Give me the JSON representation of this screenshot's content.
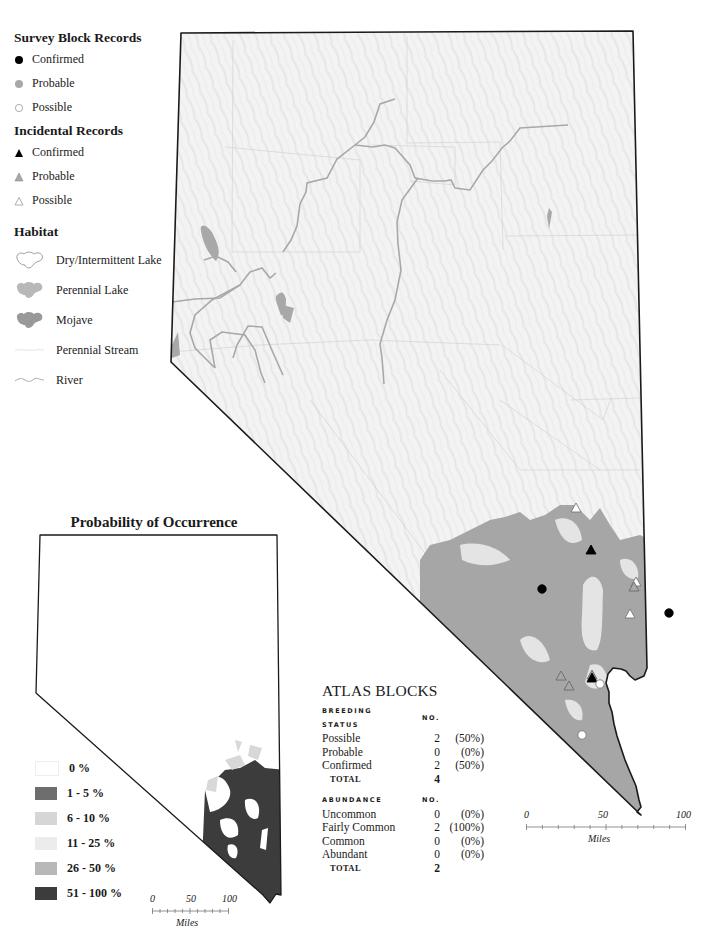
{
  "legend": {
    "survey_block": {
      "heading": "Survey Block Records",
      "items": [
        {
          "label": "Confirmed",
          "symbol": "filled-circle",
          "color": "#000000"
        },
        {
          "label": "Probable",
          "symbol": "gray-circle",
          "color": "#a8a8a8"
        },
        {
          "label": "Possible",
          "symbol": "open-circle",
          "color": "#ffffff"
        }
      ]
    },
    "incidental": {
      "heading": "Incidental Records",
      "items": [
        {
          "label": "Confirmed",
          "symbol": "filled-triangle",
          "color": "#000000"
        },
        {
          "label": "Probable",
          "symbol": "gray-triangle",
          "color": "#a8a8a8"
        },
        {
          "label": "Possible",
          "symbol": "open-triangle",
          "color": "#ffffff"
        }
      ]
    },
    "habitat": {
      "heading": "Habitat",
      "items": [
        {
          "label": "Dry/Intermittent Lake",
          "symbol": "dry-lake-icon"
        },
        {
          "label": "Perennial Lake",
          "symbol": "perennial-lake-icon",
          "color": "#b4b4b4"
        },
        {
          "label": "Mojave",
          "symbol": "mojave-icon",
          "color": "#9a9a9a"
        },
        {
          "label": "Perennial Stream",
          "symbol": "stream-icon"
        },
        {
          "label": "River",
          "symbol": "river-icon"
        }
      ]
    }
  },
  "main_map": {
    "fill": "#f2f2f2",
    "mojave_color": "#a6a6a6",
    "points": [
      {
        "type": "incidental",
        "status": "Possible",
        "x": 576,
        "y": 508
      },
      {
        "type": "incidental",
        "status": "Confirmed",
        "x": 591,
        "y": 550
      },
      {
        "type": "survey",
        "status": "Confirmed",
        "x": 542,
        "y": 589
      },
      {
        "type": "incidental",
        "status": "Possible",
        "x": 636,
        "y": 582
      },
      {
        "type": "incidental",
        "status": "Probable",
        "x": 634,
        "y": 587
      },
      {
        "type": "incidental",
        "status": "Possible",
        "x": 630,
        "y": 614
      },
      {
        "type": "survey",
        "status": "Confirmed",
        "x": 669,
        "y": 613
      },
      {
        "type": "incidental",
        "status": "Probable",
        "x": 561,
        "y": 676
      },
      {
        "type": "incidental",
        "status": "Probable",
        "x": 569,
        "y": 686
      },
      {
        "type": "incidental",
        "status": "Probable",
        "x": 592,
        "y": 675
      },
      {
        "type": "incidental",
        "status": "Confirmed",
        "x": 592,
        "y": 678
      },
      {
        "type": "survey",
        "status": "Possible",
        "x": 600,
        "y": 684
      },
      {
        "type": "survey",
        "status": "Possible",
        "x": 582,
        "y": 735
      }
    ],
    "scale": {
      "ticks": [
        "0",
        "50",
        "100"
      ],
      "unit": "Miles"
    }
  },
  "probability": {
    "title": "Probability of Occurrence",
    "classes": [
      {
        "label": "0 %",
        "color": "#ffffff"
      },
      {
        "label": "1 - 5 %",
        "color": "#6e6e6e"
      },
      {
        "label": "6 - 10 %",
        "color": "#d6d6d6"
      },
      {
        "label": "11 - 25 %",
        "color": "#ececec"
      },
      {
        "label": "26 - 50 %",
        "color": "#b8b8b8"
      },
      {
        "label": "51 - 100 %",
        "color": "#3c3c3c"
      }
    ],
    "scale": {
      "ticks": [
        "0",
        "50",
        "100"
      ],
      "unit": "Miles"
    }
  },
  "atlas_blocks": {
    "title": "ATLAS BLOCKS",
    "breeding_status": {
      "header": "BREEDING STATUS",
      "no_header": "NO.",
      "rows": [
        {
          "label": "Possible",
          "no": "2",
          "pct": "(50%)"
        },
        {
          "label": "Probable",
          "no": "0",
          "pct": "(0%)"
        },
        {
          "label": "Confirmed",
          "no": "2",
          "pct": "(50%)"
        }
      ],
      "total_label": "TOTAL",
      "total": "4"
    },
    "abundance": {
      "header": "ABUNDANCE",
      "no_header": "NO.",
      "rows": [
        {
          "label": "Uncommon",
          "no": "0",
          "pct": "(0%)"
        },
        {
          "label": "Fairly Common",
          "no": "2",
          "pct": "(100%)"
        },
        {
          "label": "Common",
          "no": "0",
          "pct": "(0%)"
        },
        {
          "label": "Abundant",
          "no": "0",
          "pct": "(0%)"
        }
      ],
      "total_label": "TOTAL",
      "total": "2"
    }
  }
}
